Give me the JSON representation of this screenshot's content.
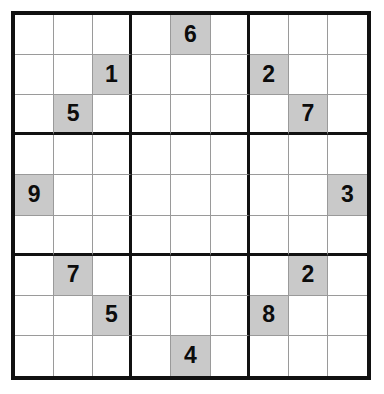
{
  "puzzle": {
    "title": "Sudoku",
    "size": 9,
    "box_size": 3,
    "colors": {
      "given_cell_background": "#c9c9c9",
      "empty_cell_background": "#ffffff",
      "thin_line": "#9a9a9a",
      "thick_line": "#111111",
      "digit": "#0c0c0c",
      "page_background": "#ffffff"
    },
    "rows": [
      [
        "",
        "",
        "",
        "",
        "6",
        "",
        "",
        "",
        ""
      ],
      [
        "",
        "",
        "1",
        "",
        "",
        "",
        "2",
        "",
        ""
      ],
      [
        "",
        "5",
        "",
        "",
        "",
        "",
        "",
        "7",
        ""
      ],
      [
        "",
        "",
        "",
        "",
        "",
        "",
        "",
        "",
        ""
      ],
      [
        "9",
        "",
        "",
        "",
        "",
        "",
        "",
        "",
        "3"
      ],
      [
        "",
        "",
        "",
        "",
        "",
        "",
        "",
        "",
        ""
      ],
      [
        "",
        "7",
        "",
        "",
        "",
        "",
        "",
        "2",
        ""
      ],
      [
        "",
        "",
        "5",
        "",
        "",
        "",
        "8",
        "",
        ""
      ],
      [
        "",
        "",
        "",
        "",
        "4",
        "",
        "",
        "",
        ""
      ]
    ],
    "givens": [
      {
        "row": 1,
        "col": 5,
        "value": "6"
      },
      {
        "row": 2,
        "col": 3,
        "value": "1"
      },
      {
        "row": 2,
        "col": 7,
        "value": "2"
      },
      {
        "row": 3,
        "col": 2,
        "value": "5"
      },
      {
        "row": 3,
        "col": 8,
        "value": "7"
      },
      {
        "row": 5,
        "col": 1,
        "value": "9"
      },
      {
        "row": 5,
        "col": 9,
        "value": "3"
      },
      {
        "row": 7,
        "col": 2,
        "value": "7"
      },
      {
        "row": 7,
        "col": 8,
        "value": "2"
      },
      {
        "row": 8,
        "col": 3,
        "value": "5"
      },
      {
        "row": 8,
        "col": 7,
        "value": "8"
      },
      {
        "row": 9,
        "col": 5,
        "value": "4"
      }
    ],
    "given_count": 12
  }
}
